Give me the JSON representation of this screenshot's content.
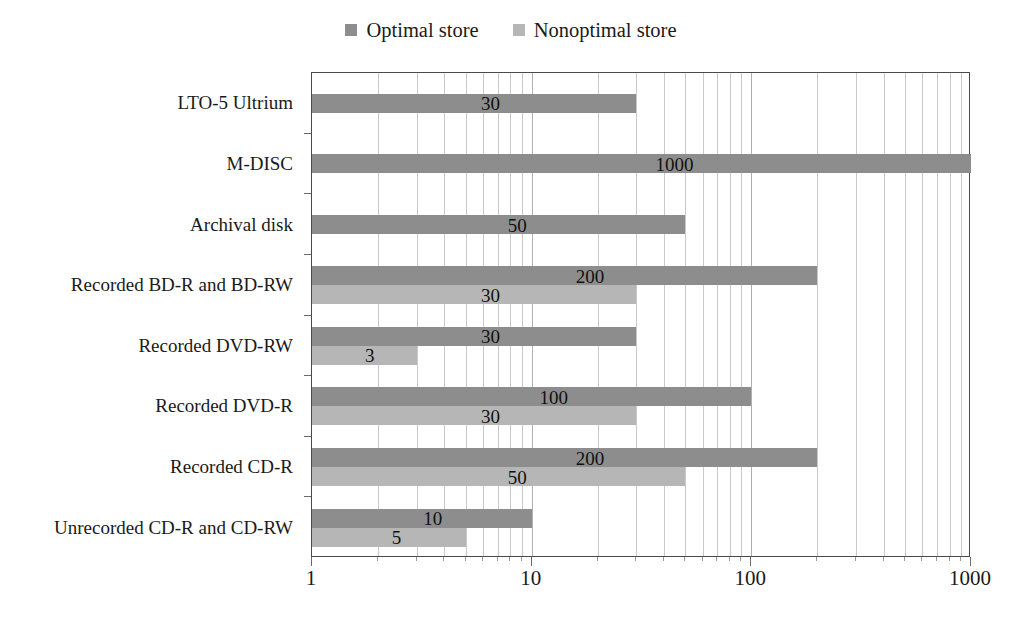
{
  "chart_data": {
    "type": "bar",
    "orientation": "horizontal",
    "title": "",
    "xlabel": "",
    "ylabel": "",
    "xscale": "log",
    "xlim": [
      1,
      1000
    ],
    "xticks": [
      1,
      10,
      100,
      1000
    ],
    "xtick_labels": [
      "1",
      "10",
      "100",
      "1000"
    ],
    "grid": true,
    "legend_position": "top-center",
    "categories": [
      "LTO-5 Ultrium",
      "M-DISC",
      "Archival disk",
      "Recorded BD-R and BD-RW",
      "Recorded DVD-RW",
      "Recorded DVD-R",
      "Recorded CD-R",
      "Unrecorded CD-R and CD-RW"
    ],
    "series": [
      {
        "name": "Optimal store",
        "color": "#8d8d8d",
        "values": [
          30,
          1000,
          50,
          200,
          30,
          100,
          200,
          10
        ],
        "labels": [
          "30",
          "1000",
          "50",
          "200",
          "30",
          "100",
          "200",
          "10"
        ]
      },
      {
        "name": "Nonoptimal store",
        "color": "#b6b6b6",
        "values": [
          null,
          null,
          null,
          30,
          3,
          30,
          50,
          5
        ],
        "labels": [
          "",
          "",
          "",
          "30",
          "3",
          "30",
          "50",
          "5"
        ]
      }
    ]
  },
  "legend": {
    "items": [
      {
        "label": "Optimal store",
        "color": "#8d8d8d"
      },
      {
        "label": "Nonoptimal store",
        "color": "#b6b6b6"
      }
    ]
  },
  "axis": {
    "x_tick_labels": [
      "1",
      "10",
      "100",
      "1000"
    ]
  },
  "colors": {
    "optimal": "#8d8d8d",
    "nonoptimal": "#b6b6b6",
    "frame": "#4a4a4a",
    "gridline": "#c9c9c9",
    "text": "#1a1a1a"
  }
}
